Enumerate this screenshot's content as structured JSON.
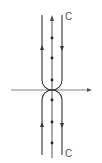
{
  "diagram": {
    "type": "contour",
    "labels": {
      "top_contour": "C",
      "bottom_contour": "C"
    },
    "colors": {
      "line": "#333333",
      "axis": "#555555",
      "background": "#ffffff"
    },
    "axis": {
      "y": 90,
      "x_start": 11,
      "x_end": 92
    },
    "poles_top_y": [
      38,
      58,
      80
    ],
    "poles_bottom_y": [
      100,
      122,
      143
    ],
    "left_line_x": 42,
    "center_line_x": 52,
    "right_line_x": 62
  }
}
